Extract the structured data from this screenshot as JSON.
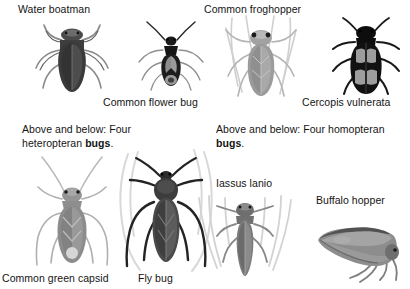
{
  "plate": {
    "width": 410,
    "height": 289,
    "background": "#ffffff",
    "text_color": "#141414"
  },
  "labels": {
    "water_boatman": "Water boatman",
    "common_flower_bug": "Common flower bug",
    "common_froghopper": "Common froghopper",
    "cercopis_vulnerata": "Cercopis vulnerata",
    "common_green_capsid": "Common green capsid",
    "fly_bug": "Fly bug",
    "iassus_lanio": "Iassus lanio",
    "buffalo_hopper": "Buffalo hopper"
  },
  "captions": {
    "heteropteran": {
      "line1": "Above and below: Four",
      "line2_prefix": "heteropteran ",
      "line2_bold": "bugs",
      "line2_suffix": "."
    },
    "homopteran": {
      "line1": "Above and below: Four homopteran",
      "line2_bold": "bugs",
      "line2_suffix": "."
    }
  },
  "figures": [
    {
      "id": "water-boatman",
      "name": "water-boatman-illustration",
      "label": "Water boatman",
      "body_color": "#3a3a3a",
      "shade_color": "#585858",
      "leg_color": "#7d7d7d"
    },
    {
      "id": "common-flower-bug",
      "name": "common-flower-bug-illustration",
      "label": "Common flower bug",
      "body_color": "#1d1d1d",
      "shade_color": "#8a8a8a",
      "leg_color": "#6e6e6e"
    },
    {
      "id": "common-froghopper",
      "name": "common-froghopper-illustration",
      "label": "Common froghopper",
      "body_color": "#9a9a9a",
      "shade_color": "#b5b5b5",
      "leg_color": "#c3c3c3"
    },
    {
      "id": "cercopis-vulnerata",
      "name": "cercopis-vulnerata-illustration",
      "label": "Cercopis vulnerata",
      "body_color": "#111111",
      "shade_color": "#9d9d9d",
      "leg_color": "#1a1a1a"
    },
    {
      "id": "common-green-capsid",
      "name": "common-green-capsid-illustration",
      "label": "Common green capsid",
      "body_color": "#8c8c8c",
      "shade_color": "#a5a5a5",
      "leg_color": "#b0b0b0"
    },
    {
      "id": "fly-bug",
      "name": "fly-bug-illustration",
      "label": "Fly bug",
      "body_color": "#3c3c3c",
      "shade_color": "#6a6a6a",
      "leg_color": "#2a2a2a"
    },
    {
      "id": "iassus-lanio",
      "name": "iassus-lanio-illustration",
      "label": "Iassus lanio",
      "body_color": "#7b7b7b",
      "shade_color": "#9b9b9b",
      "leg_color": "#6f6f6f"
    },
    {
      "id": "buffalo-hopper",
      "name": "buffalo-hopper-illustration",
      "label": "Buffalo hopper",
      "body_color": "#8d8d8d",
      "shade_color": "#a8a8a8",
      "leg_color": "#7a7a7a"
    }
  ]
}
